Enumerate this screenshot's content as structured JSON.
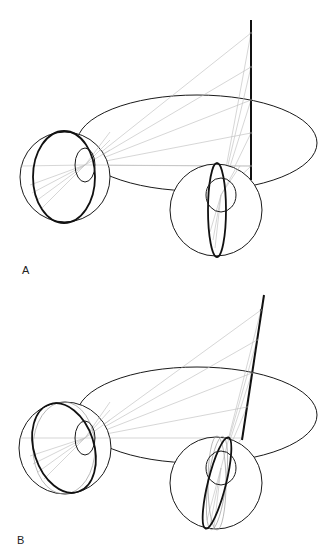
{
  "figure": {
    "panels": [
      {
        "label": "A",
        "description": "Binocular globes viewing a vertical rod; eye rotation ellipses upright",
        "rod": {
          "x1": 251,
          "y1": 20,
          "x2": 251,
          "y2": 180
        },
        "rod_ticks_y": [
          33,
          67,
          100,
          133,
          166
        ],
        "plane_ellipse": {
          "cx": 197,
          "cy": 143,
          "rx": 120,
          "ry": 48
        },
        "left_globe": {
          "cx": 65,
          "cy": 177,
          "r": 45,
          "meridian": {
            "rx": 31,
            "ry": 46,
            "rot": 0
          },
          "pupil": {
            "cx": 85,
            "cy": 165,
            "rx": 10,
            "ry": 17
          }
        },
        "right_globe": {
          "cx": 216,
          "cy": 210,
          "r": 46,
          "meridian": {
            "rx": 9,
            "ry": 47,
            "rot": 0
          },
          "pupil": {
            "cx": 221,
            "cy": 195,
            "rx": 15,
            "ry": 17
          }
        }
      },
      {
        "label": "B",
        "description": "Binocular globes viewing a tilted rod; eye meridians torted",
        "rod": {
          "x1": 264,
          "y1": 295,
          "x2": 242,
          "y2": 440
        },
        "rod_ticks": [
          [
            261,
            310
          ],
          [
            257,
            340
          ],
          [
            252,
            373
          ],
          [
            247,
            407
          ]
        ],
        "plane_ellipse": {
          "cx": 197,
          "cy": 415,
          "rx": 120,
          "ry": 48
        },
        "left_globe": {
          "cx": 65,
          "cy": 448,
          "r": 46,
          "meridian": {
            "rx": 30,
            "ry": 46,
            "rot": -18
          },
          "pupil": {
            "cx": 85,
            "cy": 438,
            "rx": 10,
            "ry": 17
          }
        },
        "right_globe": {
          "cx": 216,
          "cy": 483,
          "r": 46,
          "meridian": {
            "rx": 9,
            "ry": 47,
            "rot": 14
          },
          "pupil": {
            "cx": 221,
            "cy": 468,
            "rx": 15,
            "ry": 17
          }
        }
      }
    ]
  },
  "labels": {
    "panel_a": "A",
    "panel_b": "B"
  }
}
